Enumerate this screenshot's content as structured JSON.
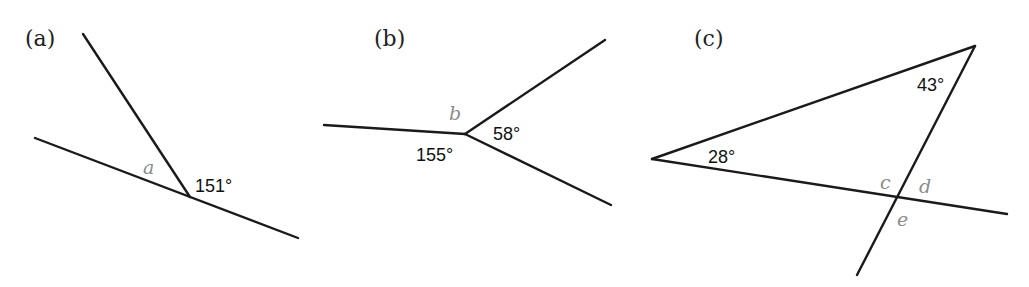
{
  "panels": [
    {
      "id": "a",
      "label": "(a)",
      "given_angles": [
        "151°"
      ],
      "unknowns": [
        "a"
      ]
    },
    {
      "id": "b",
      "label": "(b)",
      "given_angles": [
        "155°",
        "58°"
      ],
      "unknowns": [
        "b"
      ]
    },
    {
      "id": "c",
      "label": "(c)",
      "given_angles": [
        "28°",
        "43°"
      ],
      "unknowns": [
        "c",
        "d",
        "e"
      ]
    }
  ]
}
